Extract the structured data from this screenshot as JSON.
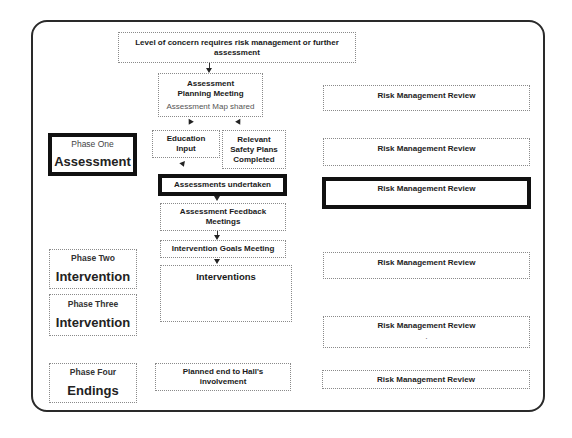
{
  "diagram": {
    "top_box": {
      "label": "Level of concern requires risk management or further assessment"
    },
    "center_flow": {
      "planning_meeting": {
        "title": "Assessment Planning Meeting",
        "subtitle": "Assessment Map shared"
      },
      "education_input": "Education Input",
      "safety_plans": "Relevant Safety Plans Completed",
      "assessments_undertaken": "Assessments undertaken",
      "feedback_meetings": "Assessment Feedback Meetings",
      "goals_meeting": "Intervention Goals Meeting",
      "interventions": "Interventions",
      "planned_end": "Planned end to Hall's involvement"
    },
    "phases": [
      {
        "label": "Phase One",
        "title": "Assessment",
        "highlighted": true
      },
      {
        "label": "Phase Two",
        "title": "Intervention",
        "highlighted": false
      },
      {
        "label": "Phase Three",
        "title": "Intervention",
        "highlighted": false
      },
      {
        "label": "Phase Four",
        "title": "Endings",
        "highlighted": false
      }
    ],
    "risk_reviews": [
      {
        "label": "Risk Management Review",
        "highlighted": false
      },
      {
        "label": "Risk Management Review",
        "highlighted": false
      },
      {
        "label": "Risk Management Review",
        "highlighted": true
      },
      {
        "label": "Risk Management Review",
        "highlighted": false
      },
      {
        "label": "Risk Management Review",
        "highlighted": false,
        "note": "."
      },
      {
        "label": "Risk Management Review",
        "highlighted": false
      }
    ],
    "colors": {
      "frame": "#2a2a2a",
      "highlight_border": "#111111",
      "dotted_border": "#8a8a8a"
    }
  }
}
